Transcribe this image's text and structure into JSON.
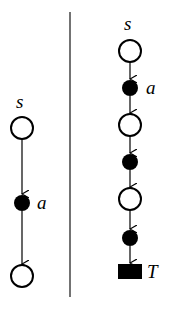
{
  "left_graph": {
    "labels": {
      "start": "s",
      "action": "a"
    },
    "nodes": [
      {
        "type": "state",
        "cx": 22,
        "cy": 128
      },
      {
        "type": "action",
        "cx": 22,
        "cy": 203
      },
      {
        "type": "state",
        "cx": 22,
        "cy": 276
      }
    ]
  },
  "right_graph": {
    "labels": {
      "start": "s",
      "action": "a",
      "terminal": "T"
    },
    "nodes": [
      {
        "type": "state",
        "cx": 130,
        "cy": 51
      },
      {
        "type": "action",
        "cx": 130,
        "cy": 88
      },
      {
        "type": "state",
        "cx": 130,
        "cy": 125
      },
      {
        "type": "action",
        "cx": 130,
        "cy": 162
      },
      {
        "type": "state",
        "cx": 130,
        "cy": 199
      },
      {
        "type": "action",
        "cx": 130,
        "cy": 238
      },
      {
        "type": "terminal",
        "cx": 130,
        "cy": 271
      }
    ]
  },
  "colors": {
    "stroke": "#000000",
    "background": "#ffffff",
    "divider": "#444444"
  }
}
